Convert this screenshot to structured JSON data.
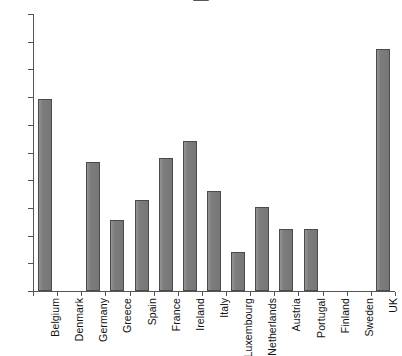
{
  "chart_data": {
    "type": "bar",
    "title": "",
    "subtitle": "",
    "xlabel": "",
    "ylabel": "",
    "ylim": [
      0,
      20
    ],
    "yticks": [
      0,
      2,
      4,
      6,
      8,
      10,
      12,
      14,
      16,
      18,
      20
    ],
    "grid": false,
    "legend": null,
    "bar_color": "#7d7d7d",
    "bar_edge_color": "#4a4a4a",
    "axis_color": "#555555",
    "categories": [
      "Belgium",
      "Denmark",
      "Germany",
      "Greece",
      "Spain",
      "France",
      "Ireland",
      "Italy",
      "Luxembourg",
      "Netherlands",
      "Austria",
      "Portugal",
      "Finland",
      "Sweden",
      "UK"
    ],
    "values": [
      13.85,
      0,
      9.3,
      5.1,
      6.6,
      9.6,
      10.8,
      7.25,
      2.85,
      6.05,
      4.45,
      4.45,
      0,
      0,
      17.5
    ]
  }
}
